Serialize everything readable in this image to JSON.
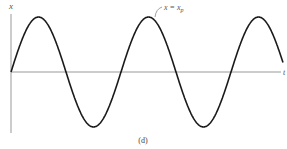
{
  "figure": {
    "y_axis_label": "x",
    "x_axis_label": "t",
    "annotation": {
      "main": "x = x",
      "subscript": "p"
    },
    "caption": "(d)"
  },
  "chart_data": {
    "type": "line",
    "title": "",
    "xlabel": "t",
    "ylabel": "x",
    "caption": "(d)",
    "function": "sine",
    "amplitude_relative": 1,
    "periods_shown": 2.5,
    "annotation": "x = x_p",
    "grid": false,
    "legend": null
  },
  "style": {
    "curve_color": "#1a1a1a",
    "axis_color": "#888888"
  }
}
